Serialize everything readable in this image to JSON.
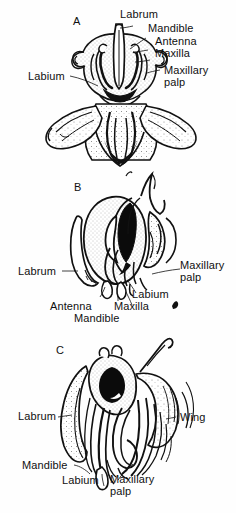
{
  "figure": {
    "background_color": "#fefefe",
    "ink_color": "#101010",
    "panel_count": 3
  },
  "panels": [
    {
      "letter": "A",
      "view": "anterior view of head with mouthparts",
      "labels": [
        {
          "text": "Labrum",
          "anchor": "top"
        },
        {
          "text": "Mandible",
          "anchor": "top-right"
        },
        {
          "text": "Antenna",
          "anchor": "right"
        },
        {
          "text": "Maxilla",
          "anchor": "right"
        },
        {
          "text": "Maxillary",
          "anchor": "right"
        },
        {
          "text": "palp",
          "anchor": "right"
        },
        {
          "text": "Labium",
          "anchor": "left"
        }
      ]
    },
    {
      "letter": "B",
      "view": "lateral view of head with mouthparts",
      "labels": [
        {
          "text": "Labrum",
          "anchor": "left"
        },
        {
          "text": "Maxillary",
          "anchor": "right"
        },
        {
          "text": "palp",
          "anchor": "right"
        },
        {
          "text": "Labium",
          "anchor": "bottom-right"
        },
        {
          "text": "Antenna",
          "anchor": "bottom-left"
        },
        {
          "text": "Maxilla",
          "anchor": "bottom"
        },
        {
          "text": "Mandible",
          "anchor": "bottom"
        }
      ]
    },
    {
      "letter": "C",
      "view": "lateral view of head with elongated mouthparts and wing",
      "labels": [
        {
          "text": "Labrum",
          "anchor": "left"
        },
        {
          "text": "Wing",
          "anchor": "right"
        },
        {
          "text": "Mandible",
          "anchor": "bottom-left"
        },
        {
          "text": "Labium",
          "anchor": "bottom"
        },
        {
          "text": "Maxillary",
          "anchor": "bottom-right"
        },
        {
          "text": "palp",
          "anchor": "bottom-right"
        }
      ]
    }
  ],
  "panel_a": {
    "letter": "A",
    "labrum": "Labrum",
    "mandible": "Mandible",
    "antenna": "Antenna",
    "maxilla": "Maxilla",
    "maxillary": "Maxillary",
    "palp": "palp",
    "labium": "Labium"
  },
  "panel_b": {
    "letter": "B",
    "labrum": "Labrum",
    "maxillary": "Maxillary",
    "palp": "palp",
    "labium": "Labium",
    "antenna": "Antenna",
    "maxilla": "Maxilla",
    "mandible": "Mandible"
  },
  "panel_c": {
    "letter": "C",
    "labrum": "Labrum",
    "wing": "Wing",
    "mandible": "Mandible",
    "labium": "Labium",
    "maxillary": "Maxillary",
    "palp": "palp"
  }
}
